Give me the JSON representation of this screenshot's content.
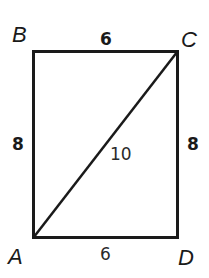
{
  "diagram": {
    "type": "rectangle-with-diagonal",
    "vertices": {
      "B": {
        "label": "B",
        "position": "top-left"
      },
      "C": {
        "label": "C",
        "position": "top-right"
      },
      "A": {
        "label": "A",
        "position": "bottom-left"
      },
      "D": {
        "label": "D",
        "position": "bottom-right"
      }
    },
    "sides": {
      "BC": {
        "label": "6",
        "bold": true
      },
      "AB": {
        "label": "8",
        "bold": true
      },
      "CD": {
        "label": "8",
        "bold": true
      },
      "AD": {
        "label": "6",
        "bold": false
      },
      "AC": {
        "label": "10",
        "bold": false,
        "kind": "diagonal"
      }
    },
    "colors": {
      "stroke": "#1a1a1a",
      "background": "#ffffff"
    }
  }
}
